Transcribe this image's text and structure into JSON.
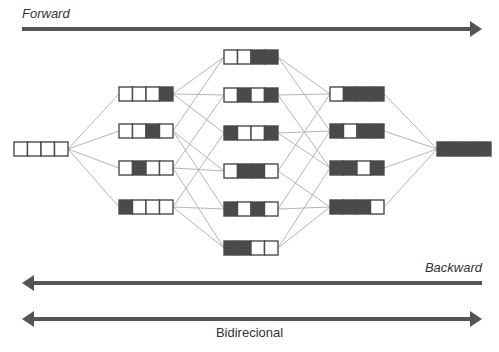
{
  "labels": {
    "forward": "Forward",
    "backward": "Backward",
    "bidirectional": "Bidirecional"
  },
  "colors": {
    "filled": "#4a4a4a",
    "empty": "#ffffff",
    "border": "#4a4a4a",
    "edge": "#b5b5b5",
    "arrow": "#555555"
  },
  "lattice": {
    "bits": 4,
    "levels": [
      {
        "x": 14,
        "nodes": [
          {
            "bits": "0000",
            "y": 142
          }
        ]
      },
      {
        "x": 119,
        "nodes": [
          {
            "bits": "0001",
            "y": 87
          },
          {
            "bits": "0010",
            "y": 124
          },
          {
            "bits": "0100",
            "y": 161
          },
          {
            "bits": "1000",
            "y": 200
          }
        ]
      },
      {
        "x": 224,
        "nodes": [
          {
            "bits": "0011",
            "y": 50
          },
          {
            "bits": "0101",
            "y": 88
          },
          {
            "bits": "1001",
            "y": 126
          },
          {
            "bits": "0110",
            "y": 164
          },
          {
            "bits": "1010",
            "y": 202
          },
          {
            "bits": "1100",
            "y": 241
          }
        ]
      },
      {
        "x": 330,
        "nodes": [
          {
            "bits": "0111",
            "y": 87
          },
          {
            "bits": "1011",
            "y": 124
          },
          {
            "bits": "1101",
            "y": 161
          },
          {
            "bits": "1110",
            "y": 200
          }
        ]
      },
      {
        "x": 437,
        "nodes": [
          {
            "bits": "1111",
            "y": 142
          }
        ]
      }
    ]
  },
  "arrows": [
    {
      "name": "forward-arrow",
      "direction": "right",
      "y": 29,
      "x1": 22,
      "x2": 482
    },
    {
      "name": "backward-arrow",
      "direction": "left",
      "y": 283,
      "x1": 22,
      "x2": 482
    },
    {
      "name": "bidirectional-arrow",
      "direction": "both",
      "y": 319,
      "x1": 22,
      "x2": 482
    }
  ]
}
